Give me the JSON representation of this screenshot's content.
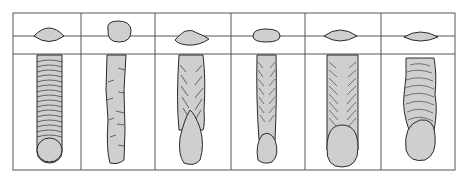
{
  "diagram": {
    "type": "weld-bead-comparison",
    "colors": {
      "fill": "#cfcfcf",
      "stroke": "#2a2a2a",
      "grid": "#555555",
      "background": "#ffffff"
    },
    "frame": {
      "x": 13,
      "y": 13,
      "w": 442,
      "h": 157
    },
    "rows": {
      "cross_section_line_y": 36,
      "divider_y": 54
    },
    "columns": [
      {
        "index": 1,
        "label": "Panel 1",
        "cross_section": "lens-shaped",
        "bead": "regular-ripples"
      },
      {
        "index": 2,
        "label": "Panel 2",
        "cross_section": "tall-round",
        "bead": "narrow-sparse-ripples"
      },
      {
        "index": 3,
        "label": "Panel 3",
        "cross_section": "humped-flat",
        "bead": "tapered-crater"
      },
      {
        "index": 4,
        "label": "Panel 4",
        "cross_section": "oval",
        "bead": "narrow-fine-ripples"
      },
      {
        "index": 5,
        "label": "Panel 5",
        "cross_section": "lens-shaped",
        "bead": "wide-chevron-ripples"
      },
      {
        "index": 6,
        "label": "Panel 6",
        "cross_section": "lens-shaped",
        "bead": "irregular-wavy"
      }
    ]
  }
}
